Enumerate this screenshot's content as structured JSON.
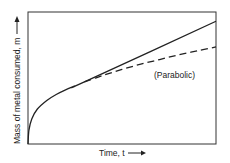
{
  "chart_data": {
    "type": "line",
    "title": "",
    "xlabel": "Time, t",
    "ylabel": "Mass of metal consumed, m",
    "x_arrow": "right-arrow",
    "y_arrow": "up-arrow",
    "xlim": [
      0,
      1
    ],
    "ylim": [
      0,
      1
    ],
    "grid": false,
    "ticks": false,
    "series": [
      {
        "name": "Linear (after transition)",
        "style": "solid",
        "color": "#222222",
        "x": [
          0,
          0.005,
          0.02,
          0.05,
          0.1,
          0.15,
          0.2,
          0.25,
          0.3,
          1.0
        ],
        "y": [
          0,
          0.105,
          0.19,
          0.265,
          0.33,
          0.375,
          0.41,
          0.44,
          0.47,
          0.93
        ]
      },
      {
        "name": "Parabolic",
        "style": "dashed",
        "color": "#222222",
        "label": "(Parabolic)",
        "x": [
          0.3,
          0.4,
          0.5,
          0.6,
          0.7,
          0.8,
          0.9,
          1.0
        ],
        "y": [
          0.47,
          0.52,
          0.565,
          0.605,
          0.64,
          0.675,
          0.705,
          0.735
        ]
      }
    ],
    "annotations": [
      {
        "text": "(Parabolic)",
        "x": 0.67,
        "y": 0.5
      }
    ]
  }
}
